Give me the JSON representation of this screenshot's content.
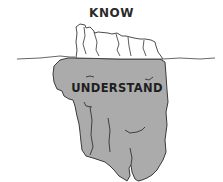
{
  "diagram": {
    "title": "",
    "above_label": "KNOW",
    "below_label": "UNDERSTAND",
    "colors": {
      "submerged_fill": "#ababab",
      "tip_fill": "#ffffff",
      "outline": "#3a3a3a",
      "text": "#222222",
      "background": "#ffffff"
    }
  }
}
